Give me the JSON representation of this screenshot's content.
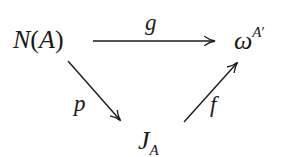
{
  "diagram": {
    "type": "commutative-diagram",
    "nodes": {
      "source": {
        "base": "N",
        "paren_open": "(",
        "arg": "A",
        "paren_close": ")"
      },
      "target": {
        "base": "ω",
        "sup_base": "A",
        "sup_prime": "′"
      },
      "middle": {
        "base": "J",
        "sub": "A"
      }
    },
    "arrows": [
      {
        "id": "g",
        "from": "N(A)",
        "to": "ω^{A'}",
        "label": "g"
      },
      {
        "id": "p",
        "from": "N(A)",
        "to": "J_A",
        "label": "p"
      },
      {
        "id": "f",
        "from": "J_A",
        "to": "ω^{A'}",
        "label": "f"
      }
    ],
    "labels": {
      "g": "g",
      "p": "p",
      "f": "f"
    },
    "colors": {
      "ink": "#1a1a1a",
      "background": "#ffffff"
    }
  }
}
